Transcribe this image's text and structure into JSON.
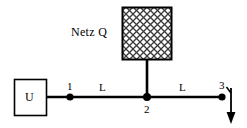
{
  "diagram": {
    "type": "single-line-electrical-network-schematic",
    "title_text": "Netz Q",
    "source_box": {
      "label": "U",
      "name": "voltage-source"
    },
    "grid_box": {
      "label": "Netz Q",
      "fill": "cross-hatch",
      "name": "network-q-block"
    },
    "nodes": [
      {
        "id": "1",
        "label": "1",
        "position": "left"
      },
      {
        "id": "2",
        "label": "2",
        "position": "middle"
      },
      {
        "id": "3",
        "label": "3",
        "position": "right"
      }
    ],
    "segments": [
      {
        "label": "L",
        "from": "1",
        "to": "2"
      },
      {
        "label": "L",
        "from": "2",
        "to": "3"
      }
    ],
    "arrow": {
      "name": "fault-current-arrow",
      "direction": "down"
    },
    "colors": {
      "stroke": "#000000",
      "background": "#ffffff",
      "hatch": "#3a3a3a"
    }
  }
}
